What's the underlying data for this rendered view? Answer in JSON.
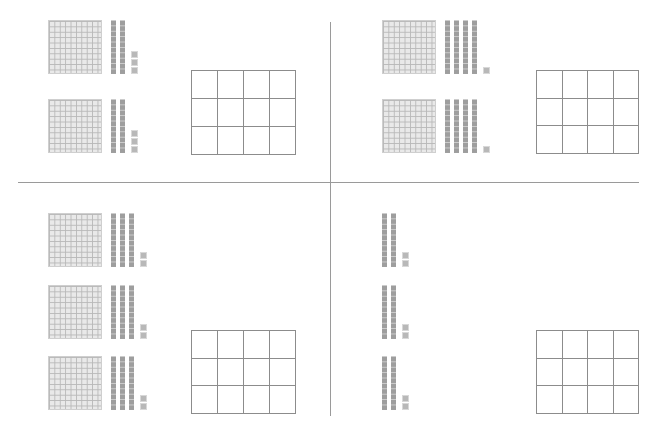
{
  "worksheet": {
    "title": "",
    "quadrants": [
      {
        "id": "top-left",
        "groups": [
          {
            "hundreds": 1,
            "tens": 2,
            "ones": 3
          },
          {
            "hundreds": 1,
            "tens": 2,
            "ones": 3
          }
        ],
        "answer_grid": {
          "rows": 3,
          "cols": 4
        }
      },
      {
        "id": "top-right",
        "groups": [
          {
            "hundreds": 1,
            "tens": 4,
            "ones": 1
          },
          {
            "hundreds": 1,
            "tens": 4,
            "ones": 1
          }
        ],
        "answer_grid": {
          "rows": 3,
          "cols": 4
        }
      },
      {
        "id": "bottom-left",
        "groups": [
          {
            "hundreds": 1,
            "tens": 3,
            "ones": 2
          },
          {
            "hundreds": 1,
            "tens": 3,
            "ones": 2
          },
          {
            "hundreds": 1,
            "tens": 3,
            "ones": 2
          }
        ],
        "answer_grid": {
          "rows": 3,
          "cols": 4
        }
      },
      {
        "id": "bottom-right",
        "groups": [
          {
            "hundreds": 0,
            "tens": 2,
            "ones": 2
          },
          {
            "hundreds": 0,
            "tens": 2,
            "ones": 2
          },
          {
            "hundreds": 0,
            "tens": 2,
            "ones": 2
          }
        ],
        "answer_grid": {
          "rows": 3,
          "cols": 4
        }
      }
    ]
  },
  "colors": {
    "divider": "#9a9a9a",
    "block_dark": "#9e9e9e",
    "block_light": "#e9e9e9",
    "grid_line": "#8c8c8c"
  }
}
